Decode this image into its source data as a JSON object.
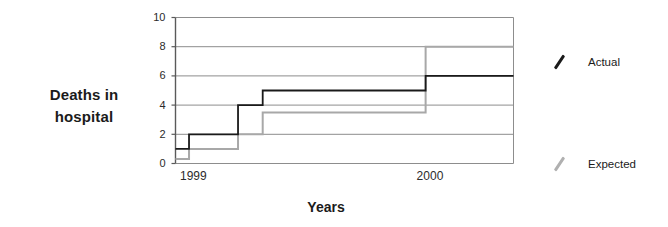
{
  "chart_data": {
    "type": "line",
    "subtype": "step",
    "title": "",
    "xlabel": "Years",
    "ylabel": "Deaths in hospital",
    "ylabel_lines": [
      "Deaths in",
      "hospital"
    ],
    "ylim": [
      0,
      10
    ],
    "yticks": [
      0,
      2,
      4,
      6,
      8,
      10
    ],
    "ytick_labels": [
      "0",
      "2",
      "4",
      "6",
      "8",
      "10"
    ],
    "xtick_labels": [
      "1999",
      "2000"
    ],
    "xtick_positions": [
      0.04,
      0.74
    ],
    "grid": true,
    "grid_axis": "y",
    "legend_position": "right",
    "series": [
      {
        "name": "Actual",
        "color": "#1a1a1a",
        "steps": [
          {
            "x": 0.0,
            "y": 1.0
          },
          {
            "x": 0.04,
            "y": 1.0
          },
          {
            "x": 0.04,
            "y": 2.0
          },
          {
            "x": 0.185,
            "y": 2.0
          },
          {
            "x": 0.185,
            "y": 4.0
          },
          {
            "x": 0.258,
            "y": 4.0
          },
          {
            "x": 0.258,
            "y": 5.0
          },
          {
            "x": 0.74,
            "y": 5.0
          },
          {
            "x": 0.74,
            "y": 6.0
          },
          {
            "x": 1.0,
            "y": 6.0
          }
        ]
      },
      {
        "name": "Expected",
        "color": "#a8a8a8",
        "steps": [
          {
            "x": 0.0,
            "y": 0.3
          },
          {
            "x": 0.04,
            "y": 0.3
          },
          {
            "x": 0.04,
            "y": 1.0
          },
          {
            "x": 0.185,
            "y": 1.0
          },
          {
            "x": 0.185,
            "y": 2.0
          },
          {
            "x": 0.258,
            "y": 2.0
          },
          {
            "x": 0.258,
            "y": 3.5
          },
          {
            "x": 0.74,
            "y": 3.5
          },
          {
            "x": 0.74,
            "y": 8.0
          },
          {
            "x": 1.0,
            "y": 8.0
          }
        ]
      }
    ]
  },
  "legend": {
    "items": [
      {
        "label": "Actual",
        "color": "#1a1a1a",
        "top": 55
      },
      {
        "label": "Expected",
        "color": "#b0b0b0",
        "top": 157
      }
    ]
  },
  "style": {
    "axis_color": "#6e6e6e",
    "grid_color": "#8d8d8d",
    "background": "#ffffff"
  }
}
